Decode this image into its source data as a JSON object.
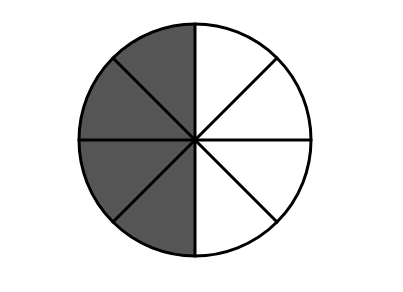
{
  "diagram": {
    "type": "fraction-circle",
    "total_parts": 8,
    "shaded_parts": 4,
    "shaded_sectors": [
      4,
      5,
      6,
      7
    ],
    "fraction_label": "4/8",
    "shaded_side": "left",
    "center": {
      "x": 195,
      "y": 140
    },
    "radius": 116,
    "stroke_width": 3,
    "colors": {
      "background": "#ffffff",
      "shaded": "#555555",
      "unshaded": "#ffffff",
      "stroke": "#000000"
    }
  }
}
